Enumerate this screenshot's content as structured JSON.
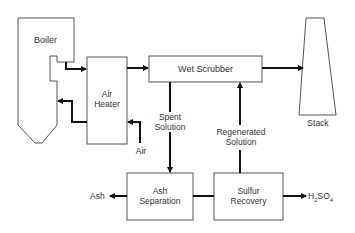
{
  "diagram": {
    "title": "",
    "nodes": {
      "boiler": {
        "label": "Boiler"
      },
      "air_heater": {
        "line1": "Air",
        "line2": "Heater"
      },
      "wet_scrubber": {
        "label": "Wet Scrubber"
      },
      "stack": {
        "label": "Stack"
      },
      "ash_separation": {
        "line1": "Ash",
        "line2": "Separation"
      },
      "sulfur_recovery": {
        "line1": "Sulfur",
        "line2": "Recovery"
      }
    },
    "streams": {
      "air": {
        "label": "Air"
      },
      "spent_solution": {
        "line1": "Spent",
        "line2": "Solution"
      },
      "regenerated_solution": {
        "line1": "Regenerated",
        "line2": "Solution"
      },
      "ash": {
        "label": "Ash"
      },
      "h2so4": {
        "prefix": "H",
        "sub1": "2",
        "mid": "SO",
        "sub2": "4"
      }
    },
    "edges": [
      {
        "from": "boiler",
        "to": "air_heater"
      },
      {
        "from": "air_heater",
        "to": "boiler"
      },
      {
        "from": "air",
        "to": "air_heater"
      },
      {
        "from": "air_heater",
        "to": "wet_scrubber"
      },
      {
        "from": "wet_scrubber",
        "to": "stack"
      },
      {
        "from": "wet_scrubber",
        "to": "ash_separation",
        "label": "Spent Solution"
      },
      {
        "from": "sulfur_recovery",
        "to": "wet_scrubber",
        "label": "Regenerated Solution"
      },
      {
        "from": "ash_separation",
        "to": "sulfur_recovery"
      },
      {
        "from": "ash_separation",
        "to": "ash"
      },
      {
        "from": "sulfur_recovery",
        "to": "h2so4"
      }
    ],
    "colors": {
      "outline": "#555555",
      "flow": "#111111",
      "text": "#333333"
    }
  }
}
